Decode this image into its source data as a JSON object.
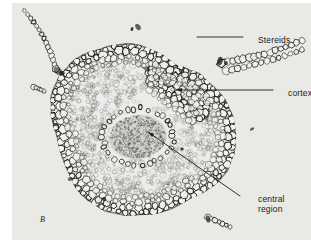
{
  "figure": {
    "letter": "B",
    "plate_background": "#e9e9e6",
    "page_background": "#ffffff",
    "ink_color": "#1b1b1b",
    "caption_color": "#1a1a1a",
    "specimen": "plant stem cross section"
  },
  "annotations": [
    {
      "id": "stereids",
      "label": "Stereids",
      "leader": "horizontal-line",
      "has_arrowhead": false,
      "label_x": 246,
      "label_y": 32,
      "line_from_x": 197,
      "line_from_y": 37,
      "line_to_x": 243,
      "line_to_y": 37,
      "points_to": "outer dark cell band"
    },
    {
      "id": "cortex",
      "label": "cortex",
      "leader": "horizontal-arrow",
      "has_arrowhead": true,
      "label_x": 276,
      "label_y": 85,
      "line_from_x": 273,
      "line_from_y": 90,
      "line_to_x": 176,
      "line_to_y": 90,
      "points_to": "middle stippled tissue"
    },
    {
      "id": "central-region",
      "label": "central\nregion",
      "label_line_1": "central",
      "label_line_2": "region",
      "leader": "diagonal-arrow",
      "has_arrowhead": true,
      "label_x": 246,
      "label_y": 191,
      "line_from_x": 240,
      "line_from_y": 196,
      "line_to_x": 148,
      "line_to_y": 132,
      "points_to": "central stele"
    }
  ],
  "regions": {
    "outer_band": {
      "name": "stereid band",
      "tone": "#262626",
      "description": "ring of thick-walled polygonal cells"
    },
    "cortex": {
      "name": "cortex",
      "tone": "#9a9a96",
      "description": "fine stippled parenchyma"
    },
    "central_region": {
      "name": "central region",
      "tone": "#c9c9c4",
      "cx": 126,
      "cy": 134,
      "rx": 29,
      "ry": 22,
      "description": "central conducting strand"
    }
  },
  "plate": {
    "left": 12,
    "top": 3,
    "width": 299,
    "height": 237
  }
}
